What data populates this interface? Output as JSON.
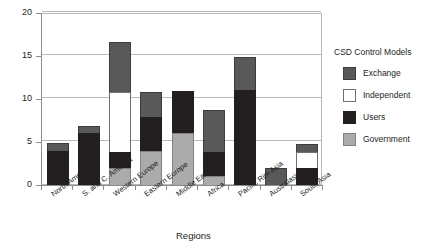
{
  "chart_data": {
    "type": "bar",
    "stacked": true,
    "title": "",
    "xlabel": "Regions",
    "ylabel": "",
    "ylim": [
      0,
      20
    ],
    "yticks": [
      0,
      5,
      10,
      15,
      20
    ],
    "grid": true,
    "legend_position": "right",
    "legend_title": "CSD Control Models",
    "categories": [
      "North America",
      "S. and C. America",
      "Western Europe",
      "Eastern Europe",
      "Middle East",
      "Africa",
      "Pacific Rim Asia",
      "Australasia",
      "South Asia"
    ],
    "series": [
      {
        "name": "Government",
        "color": "#ababab",
        "values": [
          0,
          0,
          2,
          4,
          6,
          1,
          0,
          0,
          0
        ]
      },
      {
        "name": "Users",
        "color": "#231f20",
        "values": [
          4,
          6,
          2,
          4,
          5,
          3,
          11,
          0,
          2
        ]
      },
      {
        "name": "Independent",
        "color": "#ffffff",
        "values": [
          0,
          0,
          7,
          0,
          0,
          0,
          0,
          0,
          2
        ]
      },
      {
        "name": "Exchange",
        "color": "#595959",
        "values": [
          1,
          1,
          6,
          3,
          0,
          5,
          4,
          2,
          1
        ]
      }
    ],
    "totals": [
      5,
      7,
      17,
      11,
      11,
      9,
      15,
      2,
      5
    ],
    "legend_order": [
      "Exchange",
      "Independent",
      "Users",
      "Government"
    ]
  }
}
